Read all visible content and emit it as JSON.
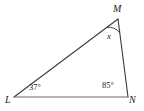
{
  "figure": {
    "type": "triangle-geometry-diagram",
    "background_color": "#ffffff",
    "stroke_color": "#3a3a3a",
    "text_color": "#1a1a1a",
    "vertices": [
      {
        "name": "M",
        "label": "M",
        "x": 118,
        "y": 19
      },
      {
        "name": "L",
        "label": "L",
        "x": 14,
        "y": 97
      },
      {
        "name": "N",
        "label": "N",
        "x": 128,
        "y": 97
      }
    ],
    "sides": [
      {
        "name": "LM",
        "from": "L",
        "to": "M"
      },
      {
        "name": "MN",
        "from": "M",
        "to": "N"
      },
      {
        "name": "LN",
        "from": "L",
        "to": "N"
      }
    ],
    "angles": {
      "at_L": "37°",
      "at_N": "85°",
      "at_M": "x"
    },
    "arc": {
      "at_vertex": "M",
      "radius": 14
    }
  }
}
